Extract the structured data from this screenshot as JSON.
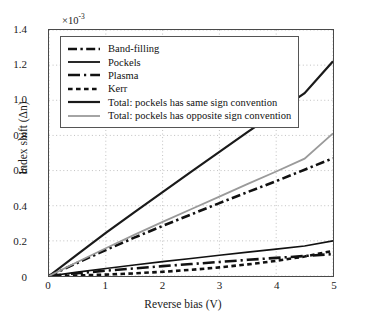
{
  "chart_data": {
    "type": "line",
    "title": "",
    "xlabel": "Reverse bias (V)",
    "ylabel": "Index shift (Δn)",
    "multiplier": "×10",
    "multiplier_exp": "-3",
    "xlim": [
      0,
      5
    ],
    "ylim": [
      0,
      1.4
    ],
    "xticks": [
      "0",
      "1",
      "2",
      "3",
      "4",
      "5"
    ],
    "yticks": [
      "0",
      "0.2",
      "0.4",
      "0.6",
      "0.8",
      "1.0",
      "1.2",
      "1.4"
    ],
    "grid": true,
    "legend_position": "top-left",
    "x": [
      0,
      0.5,
      1,
      1.5,
      2,
      2.5,
      3,
      3.5,
      4,
      4.5,
      5
    ],
    "series": [
      {
        "name": "Band-filling",
        "style": "dashdot",
        "color": "#111111",
        "width": 2.6,
        "values": [
          0,
          0.075,
          0.148,
          0.218,
          0.285,
          0.35,
          0.415,
          0.478,
          0.54,
          0.605,
          0.67
        ]
      },
      {
        "name": "Pockels",
        "style": "solid",
        "color": "#111111",
        "width": 1.6,
        "values": [
          0,
          0.022,
          0.043,
          0.063,
          0.082,
          0.1,
          0.118,
          0.136,
          0.153,
          0.171,
          0.2
        ]
      },
      {
        "name": "Plasma",
        "style": "longdashdot",
        "color": "#111111",
        "width": 2.6,
        "values": [
          0,
          0.016,
          0.03,
          0.043,
          0.056,
          0.068,
          0.08,
          0.092,
          0.103,
          0.114,
          0.125
        ]
      },
      {
        "name": "Kerr",
        "style": "dotted",
        "color": "#111111",
        "width": 2.6,
        "values": [
          0,
          0.003,
          0.008,
          0.015,
          0.024,
          0.035,
          0.049,
          0.066,
          0.086,
          0.111,
          0.143
        ]
      },
      {
        "name": "Total: pockels has same sign convention",
        "style": "solid",
        "color": "#1a1a1a",
        "width": 2.2,
        "values": [
          0,
          0.123,
          0.245,
          0.362,
          0.478,
          0.592,
          0.706,
          0.82,
          0.93,
          1.04,
          1.222
        ]
      },
      {
        "name": "Total: pockels has opposite sign convention",
        "style": "solid",
        "color": "#9a9a9a",
        "width": 1.8,
        "values": [
          0,
          0.08,
          0.158,
          0.234,
          0.308,
          0.38,
          0.452,
          0.524,
          0.595,
          0.668,
          0.812
        ]
      }
    ]
  }
}
